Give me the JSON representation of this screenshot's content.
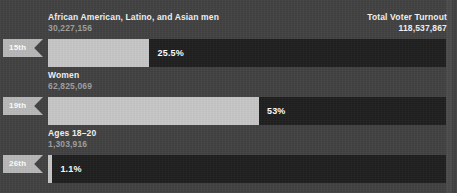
{
  "header": {
    "left_title": "",
    "left_value": "",
    "right_title": "Total Voter Turnout",
    "right_value": "118,537,867"
  },
  "colors": {
    "background": "#414141",
    "track": "#1e1e1e",
    "fill": "#c6c6c6",
    "badge": "#b8b8b8",
    "title_text": "#f2f2f2",
    "count_text": "#9e9e9e",
    "pct_text": "#ffffff"
  },
  "chart_data": {
    "type": "bar",
    "title": "Total Voter Turnout",
    "total_label": "Total Voter Turnout",
    "total_value": 118537867,
    "total_value_text": "118,537,867",
    "xlabel": "",
    "ylabel": "",
    "xlim": [
      0,
      100
    ],
    "unit": "percent of total voter turnout",
    "grid": false,
    "legend": "none",
    "categories": [
      "African American, Latino, and Asian men",
      "Women",
      "Ages 18–20"
    ],
    "values": [
      25.5,
      53,
      1.1
    ],
    "value_labels": [
      "25.5%",
      "53%",
      "1.1%"
    ],
    "counts": [
      30227156,
      62825069,
      1303916
    ],
    "count_labels": [
      "30,227,156",
      "62,825,069",
      "1,303,916"
    ],
    "badges": [
      "15th",
      "19th",
      "26th"
    ],
    "rows": [
      {
        "name": "African American, Latino, and Asian men",
        "count": "30,227,156",
        "badge": "15th",
        "pct": "25.5%",
        "pct_value": 25.5
      },
      {
        "name": "Women",
        "count": "62,825,069",
        "badge": "19th",
        "pct": "53%",
        "pct_value": 53
      },
      {
        "name": "Ages 18–20",
        "count": "1,303,916",
        "badge": "26th",
        "pct": "1.1%",
        "pct_value": 1.1
      }
    ]
  }
}
